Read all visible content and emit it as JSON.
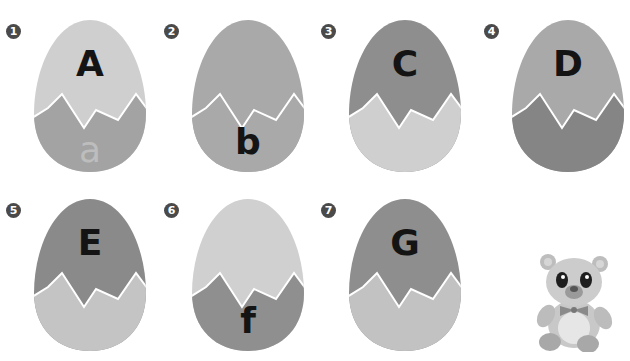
{
  "colors": {
    "light": "#cfcfcf",
    "mid": "#a6a6a6",
    "dark": "#8a8a8a",
    "crack": "#ffffff",
    "text_dark": "#141414",
    "text_faint": "#bdbdbd",
    "badge": "#4a4a4a"
  },
  "eggs": [
    {
      "number": "1",
      "letter": "A",
      "letter_pos": "top",
      "lower": "a",
      "top_color": "#cfcfcf",
      "bottom_color": "#a3a3a3",
      "left": 32,
      "top": 18
    },
    {
      "number": "2",
      "letter": "b",
      "letter_pos": "bottom",
      "top_color": "#a9a9a9",
      "bottom_color": "#a9a9a9",
      "left": 190,
      "top": 18
    },
    {
      "number": "3",
      "letter": "C",
      "letter_pos": "top",
      "top_color": "#8e8e8e",
      "bottom_color": "#cfcfcf",
      "left": 347,
      "top": 18
    },
    {
      "number": "4",
      "letter": "D",
      "letter_pos": "top",
      "top_color": "#a9a9a9",
      "bottom_color": "#858585",
      "left": 510,
      "top": 18
    },
    {
      "number": "5",
      "letter": "E",
      "letter_pos": "top",
      "top_color": "#8a8a8a",
      "bottom_color": "#c4c4c4",
      "left": 32,
      "top": 197
    },
    {
      "number": "6",
      "letter": "f",
      "letter_pos": "bottom",
      "top_color": "#d0d0d0",
      "bottom_color": "#8f8f8f",
      "left": 190,
      "top": 197
    },
    {
      "number": "7",
      "letter": "G",
      "letter_pos": "top",
      "top_color": "#8e8e8e",
      "bottom_color": "#c2c2c2",
      "left": 347,
      "top": 197
    }
  ],
  "decoration": {
    "bear": "teddy-bear-illustration"
  }
}
